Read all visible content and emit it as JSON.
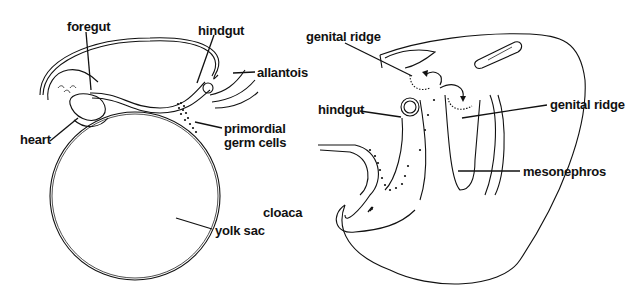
{
  "figure": {
    "left_panel": {
      "description": "Sagittal section of early embryo showing gut tube, yolk sac and primordial germ cells",
      "labels": {
        "foregut": "foregut",
        "hindgut": "hindgut",
        "allantois": "allantois",
        "heart": "heart",
        "primordial_germ_cells_line1": "primordial",
        "primordial_germ_cells_line2": "germ cells",
        "yolk_sac": "yolk sac"
      }
    },
    "right_panel": {
      "description": "Embryo posterior region showing migration of germ cells from hindgut to genital ridges",
      "labels": {
        "genital_ridge_top": "genital ridge",
        "genital_ridge_right": "genital ridge",
        "hindgut": "hindgut",
        "mesonephros": "mesonephros",
        "cloaca": "cloaca"
      }
    },
    "colors": {
      "ink": "#111111",
      "background": "#ffffff"
    }
  }
}
